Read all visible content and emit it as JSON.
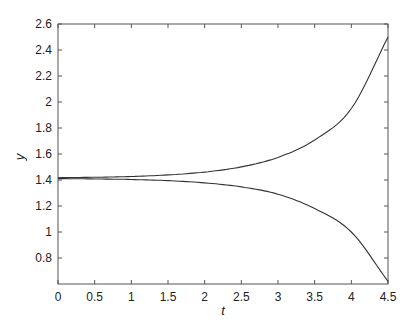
{
  "chart_data": {
    "type": "line",
    "title": "",
    "xlabel": "t",
    "ylabel": "y",
    "xlim": [
      0,
      4.5
    ],
    "ylim": [
      0.6,
      2.6
    ],
    "grid": false,
    "legend": null,
    "x_ticks": [
      "0",
      "0.5",
      "1",
      "1.5",
      "2",
      "2.5",
      "3",
      "3.5",
      "4",
      "4.5"
    ],
    "y_ticks": [
      "0.8",
      "1",
      "1.2",
      "1.4",
      "1.6",
      "1.8",
      "2",
      "2.2",
      "2.4",
      "2.6"
    ],
    "x": [
      0,
      0.5,
      1,
      1.5,
      2,
      2.5,
      3,
      3.5,
      4,
      4.5
    ],
    "series": [
      {
        "name": "upper",
        "values": [
          1.418,
          1.421,
          1.427,
          1.439,
          1.461,
          1.501,
          1.574,
          1.708,
          1.95,
          2.5
        ]
      },
      {
        "name": "lower",
        "values": [
          1.411,
          1.408,
          1.404,
          1.395,
          1.378,
          1.347,
          1.291,
          1.18,
          1.0,
          0.62
        ]
      }
    ],
    "line_color": "#333333"
  }
}
